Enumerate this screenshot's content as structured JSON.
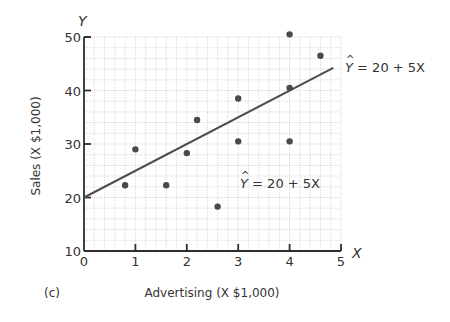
{
  "chart_data": {
    "type": "scatter",
    "title": "",
    "panel_label": "(c)",
    "xlabel": "Advertising (X $1,000)",
    "ylabel": "Sales (X $1,000)",
    "x_axis_symbol": "X",
    "y_axis_symbol": "Y",
    "xlim": [
      0,
      5
    ],
    "ylim": [
      10,
      50
    ],
    "x_ticks": [
      0,
      1,
      2,
      3,
      4,
      5
    ],
    "y_ticks": [
      10,
      20,
      30,
      40,
      50
    ],
    "grid": true,
    "series": [
      {
        "name": "observations",
        "points": [
          {
            "x": 0.8,
            "y": 22.3
          },
          {
            "x": 1.0,
            "y": 29.0
          },
          {
            "x": 1.6,
            "y": 22.3
          },
          {
            "x": 2.0,
            "y": 28.3
          },
          {
            "x": 2.2,
            "y": 34.5
          },
          {
            "x": 2.6,
            "y": 18.3
          },
          {
            "x": 3.0,
            "y": 38.5
          },
          {
            "x": 3.0,
            "y": 30.5
          },
          {
            "x": 4.0,
            "y": 50.5
          },
          {
            "x": 4.0,
            "y": 40.5
          },
          {
            "x": 4.0,
            "y": 30.5
          },
          {
            "x": 4.6,
            "y": 46.5
          }
        ]
      }
    ],
    "regression_line": {
      "intercept": 20,
      "slope": 5,
      "x_from": 0,
      "x_to": 4.85
    },
    "annotations": [
      {
        "text_hat": "Y",
        "text_rest": " = 20 + 5X",
        "position": "line-end"
      },
      {
        "text_hat": "Y",
        "text_rest": " = 20 + 5X",
        "position": "inside-plot"
      }
    ]
  },
  "colors": {
    "axis": "#2e2e2e",
    "grid": "#c8c8c8",
    "point": "#4a4a4a",
    "line": "#4d4d4d"
  }
}
